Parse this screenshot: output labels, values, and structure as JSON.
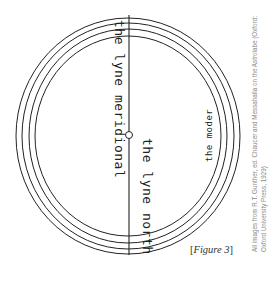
{
  "figure": {
    "labels": {
      "meridional": "the lyne meridional",
      "north": "the lyne north",
      "moder": "the moder"
    },
    "caption": {
      "open": "[",
      "text": "Figure 3",
      "close": "]"
    },
    "credit": {
      "line1": "All images from R.T. Gunther, ed. Chaucer and Messahalla on the Astrolabe (Oxford:",
      "line2": "Oxford University Press, 1929)"
    },
    "colors": {
      "ink": "#222222",
      "credit": "#8a8a8a",
      "background": "#ffffff"
    }
  }
}
